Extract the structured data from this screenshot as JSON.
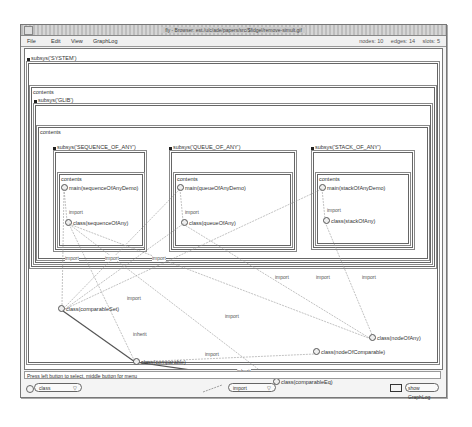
{
  "window": {
    "title": "fly - Browser: est./u/c/ade/papers/src/$fidgel/remove-simult.gif",
    "menu": [
      "File",
      "Edit",
      "View",
      "GraphLog"
    ],
    "stats": {
      "nodes": "nodes: 10",
      "edges": "edges: 14",
      "slots": "slots: 5"
    }
  },
  "graph": {
    "subsys_system": "subsys('SYSTEM')",
    "contents_label": "contents",
    "subsys_glib": "subsys('GLIB')",
    "subsystems": [
      {
        "title": "subsys('SEQUENCE_OF_ANY')",
        "main": "main(sequenceOfAnyDemo)",
        "import": "import",
        "cls": "class(sequenceOfAny)"
      },
      {
        "title": "subsys('QUEUE_OF_ANY')",
        "main": "main(queueOfAnyDemo)",
        "import": "import",
        "cls": "class(queueOfAny)"
      },
      {
        "title": "subsys('STACK_OF_ANY')",
        "main": "main(stackOfAnyDemo)",
        "import": "import",
        "cls": "class(stackOfAny)"
      }
    ],
    "outer_nodes": {
      "comparableSet": "class(comparableSet)",
      "nodeOfAny": "class(nodeOfAny)",
      "nodeOfComparable": "class(nodeOfComparable)",
      "comparable": "class(comparable)",
      "comparableEq": "class(comparableEq)"
    },
    "edge_labels": {
      "import": "import",
      "inherit": "inherit"
    }
  },
  "status": {
    "message": "Press left button to select, middle button for menu"
  },
  "bottom": {
    "node_type": "class",
    "edge_type": "import",
    "show_graphlog": "show GraphLog"
  }
}
